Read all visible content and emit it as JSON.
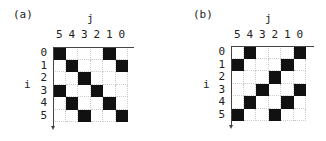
{
  "panels": [
    {
      "tag": "(a)",
      "x_axis_label": "j",
      "y_axis_label": "i",
      "column_labels": [
        "5",
        "4",
        "3",
        "2",
        "1",
        "0"
      ],
      "row_labels": [
        "0",
        "1",
        "2",
        "3",
        "4",
        "5"
      ],
      "filled_cells": [
        [
          1,
          0,
          0,
          0,
          1,
          0
        ],
        [
          0,
          1,
          0,
          0,
          0,
          1
        ],
        [
          0,
          0,
          1,
          0,
          0,
          0
        ],
        [
          1,
          0,
          0,
          1,
          0,
          0
        ],
        [
          0,
          1,
          0,
          0,
          1,
          0
        ],
        [
          0,
          0,
          1,
          0,
          0,
          1
        ]
      ]
    },
    {
      "tag": "(b)",
      "x_axis_label": "j",
      "y_axis_label": "i",
      "column_labels": [
        "5",
        "4",
        "3",
        "2",
        "1",
        "0"
      ],
      "row_labels": [
        "0",
        "1",
        "2",
        "3",
        "4",
        "5"
      ],
      "filled_cells": [
        [
          0,
          1,
          0,
          0,
          0,
          1
        ],
        [
          1,
          0,
          0,
          0,
          1,
          0
        ],
        [
          0,
          0,
          0,
          1,
          0,
          0
        ],
        [
          0,
          0,
          1,
          0,
          0,
          1
        ],
        [
          0,
          1,
          0,
          0,
          1,
          0
        ],
        [
          1,
          0,
          0,
          1,
          0,
          0
        ]
      ]
    }
  ],
  "colors": {
    "filled": "#111111",
    "grid": "#cccccc",
    "axis": "#444444"
  }
}
